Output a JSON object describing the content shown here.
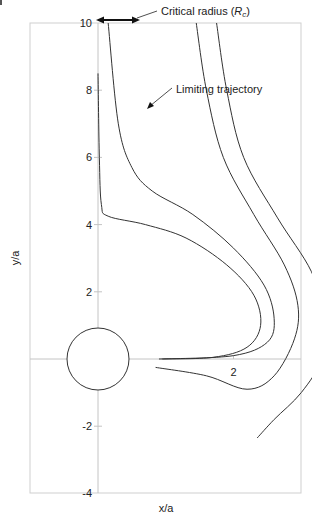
{
  "chart_data": {
    "type": "line",
    "title": "",
    "xlabel": "x/a",
    "ylabel": "y/a",
    "xlim": [
      -2,
      6
    ],
    "ylim": [
      -4,
      10
    ],
    "x_ticks": [
      "-2",
      "2",
      "4",
      "6"
    ],
    "y_ticks": [
      "-4",
      "-2",
      "2",
      "4",
      "6",
      "8",
      "10"
    ],
    "grid": false,
    "legend": null,
    "collector": {
      "shape": "circle",
      "center": [
        0,
        0
      ],
      "radius": 0.9
    },
    "annotations": [
      {
        "text": "Critical radius (R_c)",
        "text_main": "Critical radius (",
        "text_italic": "R",
        "text_sub": "c",
        "text_end": ")",
        "points_to": "double arrow spanning x=0 to x=1.45 at y=10"
      },
      {
        "text": "Limiting trajectory",
        "points_to": [
          1.45,
          7.5
        ]
      }
    ],
    "series": [
      {
        "name": "trajectory-1",
        "points": [
          [
            0.0,
            8.5
          ],
          [
            0.02,
            6.0
          ],
          [
            0.05,
            4.6
          ],
          [
            0.15,
            4.25
          ],
          [
            0.7,
            4.0
          ],
          [
            1.3,
            3.6
          ],
          [
            1.9,
            2.8
          ],
          [
            2.3,
            1.9
          ],
          [
            2.4,
            1.0
          ],
          [
            2.2,
            0.35
          ],
          [
            1.7,
            0.05
          ],
          [
            0.9,
            0.0
          ]
        ]
      },
      {
        "name": "trajectory-2",
        "points": [
          [
            0.15,
            10.0
          ],
          [
            0.3,
            7.0
          ],
          [
            0.5,
            5.7
          ],
          [
            0.8,
            5.0
          ],
          [
            1.4,
            4.3
          ],
          [
            2.0,
            3.3
          ],
          [
            2.45,
            2.2
          ],
          [
            2.6,
            1.2
          ],
          [
            2.5,
            0.5
          ],
          [
            2.0,
            0.1
          ],
          [
            0.95,
            0.0
          ]
        ]
      },
      {
        "name": "limiting-trajectory",
        "points": [
          [
            1.45,
            10.0
          ],
          [
            1.6,
            8.0
          ],
          [
            1.85,
            6.0
          ],
          [
            2.3,
            4.3
          ],
          [
            2.75,
            2.8
          ],
          [
            2.95,
            1.6
          ],
          [
            2.9,
            0.6
          ],
          [
            2.6,
            -0.5
          ],
          [
            2.2,
            -0.9
          ],
          [
            1.6,
            -0.5
          ],
          [
            0.85,
            -0.25
          ]
        ]
      },
      {
        "name": "trajectory-4",
        "points": [
          [
            1.75,
            10.0
          ],
          [
            1.9,
            8.0
          ],
          [
            2.15,
            6.0
          ],
          [
            2.65,
            4.2
          ],
          [
            3.15,
            2.6
          ],
          [
            3.35,
            1.2
          ],
          [
            3.3,
            0.0
          ],
          [
            3.0,
            -1.0
          ],
          [
            2.6,
            -1.8
          ],
          [
            2.35,
            -2.35
          ]
        ]
      }
    ]
  },
  "labels": {
    "critical_radius_prefix": "Critical radius (",
    "critical_radius_R": "R",
    "critical_radius_sub": "c",
    "critical_radius_suffix": ")",
    "limiting_trajectory": "Limiting trajectory",
    "x_axis_title": "x/a",
    "y_axis_title": "y/a"
  },
  "ticks": {
    "x": [
      {
        "label": "-2",
        "v": -2
      },
      {
        "label": "2",
        "v": 2
      },
      {
        "label": "4",
        "v": 4
      },
      {
        "label": "6",
        "v": 6
      }
    ],
    "y": [
      {
        "label": "10",
        "v": 10
      },
      {
        "label": "8",
        "v": 8
      },
      {
        "label": "6",
        "v": 6
      },
      {
        "label": "4",
        "v": 4
      },
      {
        "label": "2",
        "v": 2
      },
      {
        "label": "-2",
        "v": -2
      },
      {
        "label": "-4",
        "v": -4
      }
    ]
  }
}
